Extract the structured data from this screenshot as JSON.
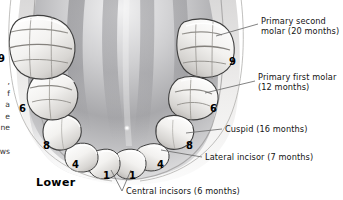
{
  "figure": {
    "domain": "anatomical-illustration",
    "view_label": "Lower",
    "background_color": "#ffffff",
    "text_color": "#141414",
    "leader_line_color": "#6d6d6d",
    "tooth_fill": "#f4f3f1",
    "tooth_outline": "#4a4a4a",
    "mouth_floor_color": "#8e8e90"
  },
  "callouts": [
    {
      "id": "primary-second-molar",
      "line1": "Primary second",
      "line2": "molar (20 months)",
      "text": "Primary second\nmolar (20 months)"
    },
    {
      "id": "primary-first-molar",
      "line1": "Primary first molar",
      "line2": "(12 months)",
      "text": "Primary first molar\n(12 months)"
    },
    {
      "id": "cuspid",
      "line1": "Cuspid (16 months)",
      "line2": "",
      "text": "Cuspid (16 months)"
    },
    {
      "id": "lateral-incisor",
      "line1": "Lateral incisor (7 months)",
      "line2": "",
      "text": "Lateral incisor (7 months)"
    },
    {
      "id": "central-incisors",
      "line1": "Central incisors (6 months)",
      "line2": "",
      "text": "Central incisors (6 months)"
    }
  ],
  "numbers": {
    "right_second_molar": "9",
    "right_first_molar": "6",
    "right_cuspid": "8",
    "right_lateral_incisor": "4",
    "left_central_incisor": "1",
    "right_central_incisor": "1",
    "left_lateral_incisor": "4",
    "left_cuspid": "8",
    "left_first_molar": "6",
    "left_second_molar": "9"
  },
  "cropped_edge_text": {
    "lines": ",\nf\na\ne\nne\n\nws",
    "number": "9"
  }
}
